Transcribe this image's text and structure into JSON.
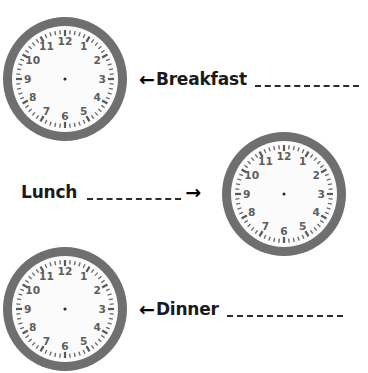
{
  "page": {
    "background_color": "#ffffff",
    "width": 368,
    "height": 373,
    "kind": "worksheet"
  },
  "clock_style": {
    "bezel_color": "#6f6f6f",
    "face_color": "#fbfbfb",
    "numeral_color": "#5e5e5e",
    "tick_color": "#6b6b6b",
    "center_dot_color": "#2a2a2a",
    "hands": "none"
  },
  "clock_numerals": [
    "12",
    "1",
    "2",
    "3",
    "4",
    "5",
    "6",
    "7",
    "8",
    "9",
    "10",
    "11"
  ],
  "clocks": [
    {
      "id": "breakfast-clock",
      "name": "clock-face-breakfast",
      "x": 3,
      "y": 17,
      "size": 124,
      "time_shown": ""
    },
    {
      "id": "lunch-clock",
      "name": "clock-face-lunch",
      "x": 222,
      "y": 132,
      "size": 124,
      "time_shown": ""
    },
    {
      "id": "dinner-clock",
      "name": "clock-face-dinner",
      "x": 3,
      "y": 247,
      "size": 124,
      "time_shown": ""
    }
  ],
  "meals": [
    {
      "id": "breakfast",
      "label": "Breakfast",
      "arrow": "←",
      "arrow_direction": "left",
      "arrow_position": "before",
      "answer_value": "",
      "blank_width": 104,
      "x": 139,
      "y": 70
    },
    {
      "id": "lunch",
      "label": "Lunch",
      "arrow": "→",
      "arrow_direction": "right",
      "arrow_position": "after",
      "answer_value": "",
      "blank_width": 94,
      "x": 21,
      "y": 183
    },
    {
      "id": "dinner",
      "label": "Dinner",
      "arrow": "←",
      "arrow_direction": "left",
      "arrow_position": "before",
      "answer_value": "",
      "blank_width": 116,
      "x": 139,
      "y": 300
    }
  ]
}
